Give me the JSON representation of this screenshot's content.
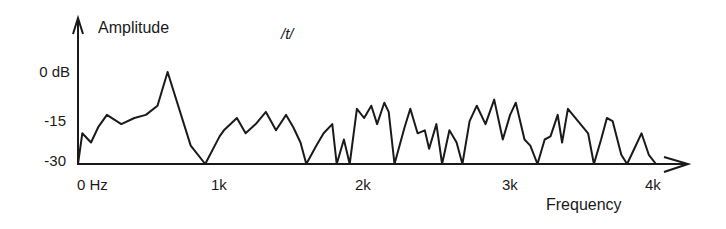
{
  "chart_data": {
    "type": "line",
    "title": "/t/",
    "xlabel": "Frequency",
    "ylabel": "Amplitude",
    "x_ticks": [
      "0 Hz",
      "1k",
      "2k",
      "3k",
      "4k"
    ],
    "y_ticks": [
      "0 dB",
      "-15",
      "-30"
    ],
    "xlim": [
      0,
      4000
    ],
    "ylim": [
      -30,
      0
    ],
    "grid": false,
    "legend": null,
    "series": [
      {
        "name": "/t/ spectrum",
        "x": [
          0,
          30,
          90,
          140,
          200,
          300,
          390,
          470,
          550,
          620,
          780,
          880,
          980,
          1010,
          1100,
          1160,
          1230,
          1300,
          1370,
          1440,
          1490,
          1540,
          1580,
          1650,
          1700,
          1760,
          1790,
          1840,
          1880,
          1930,
          1980,
          2030,
          2070,
          2120,
          2150,
          2190,
          2260,
          2300,
          2350,
          2400,
          2430,
          2480,
          2520,
          2570,
          2620,
          2660,
          2710,
          2760,
          2820,
          2880,
          2940,
          2990,
          3030,
          3090,
          3130,
          3180,
          3230,
          3270,
          3320,
          3350,
          3390,
          3460,
          3530,
          3570,
          3620,
          3660,
          3700,
          3760,
          3800,
          3850,
          3900,
          3950,
          4000
        ],
        "y": [
          -30,
          -20,
          -23,
          -18,
          -14,
          -17,
          -15,
          -14,
          -11,
          0,
          -24,
          -30,
          -21,
          -19,
          -15,
          -20,
          -17,
          -13,
          -19,
          -14,
          -18,
          -23,
          -30,
          -24,
          -20,
          -17,
          -30,
          -22,
          -30,
          -12,
          -15,
          -11,
          -17,
          -10,
          -13,
          -30,
          -18,
          -12,
          -20,
          -19,
          -25,
          -17,
          -30,
          -19,
          -23,
          -30,
          -16,
          -11,
          -17,
          -9,
          -22,
          -14,
          -10,
          -22,
          -24,
          -30,
          -22,
          -21,
          -14,
          -23,
          -12,
          -16,
          -20,
          -30,
          -22,
          -15,
          -16,
          -27,
          -30,
          -25,
          -20,
          -27,
          -30
        ]
      }
    ],
    "pixel_map": {
      "x0": 78,
      "x1": 656,
      "y0dB": 72,
      "y30dB": 164
    },
    "colors": {
      "line": "#1a1a1a",
      "axis": "#1a1a1a",
      "background": "#ffffff"
    }
  },
  "labels": {
    "ylabel": "Amplitude",
    "xlabel": "Frequency",
    "phoneme": "/t/",
    "y_ticks": [
      "0 dB",
      "-15",
      "-30"
    ],
    "x_ticks": [
      "0 Hz",
      "1k",
      "2k",
      "3k",
      "4k"
    ]
  }
}
